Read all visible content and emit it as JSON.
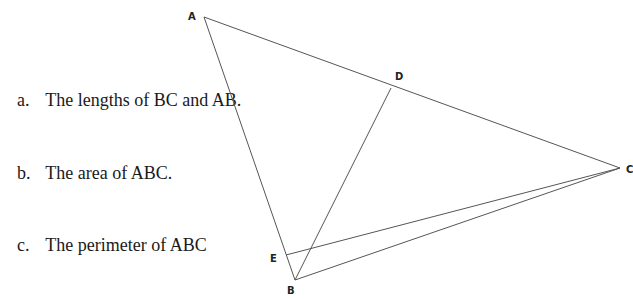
{
  "questions": [
    {
      "label": "a.",
      "text": "The lengths of BC and AB."
    },
    {
      "label": "b.",
      "text": "The area of ABC."
    },
    {
      "label": "c.",
      "text": "The perimeter of ABC"
    }
  ],
  "diagram": {
    "points": {
      "A": "A",
      "B": "B",
      "C": "C",
      "D": "D",
      "E": "E"
    },
    "segments": [
      "AB",
      "BC",
      "CA",
      "BD",
      "EC"
    ],
    "line_color": "#555555"
  }
}
